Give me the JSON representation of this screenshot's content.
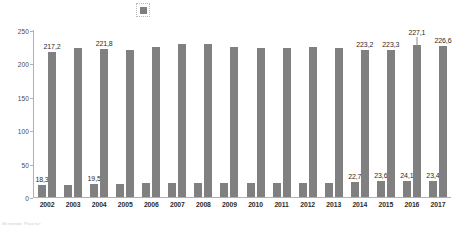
{
  "legend": {
    "marker_name": "series-swatch",
    "marker_color": "#7f7f7f"
  },
  "footnote": {
    "text": "Источник: Росстат"
  },
  "chart_data": {
    "type": "bar",
    "title": "",
    "subtitle": "",
    "xlabel": "",
    "ylabel": "",
    "ylim": [
      0,
      250
    ],
    "yticks": [
      0,
      50,
      100,
      150,
      200,
      250
    ],
    "ytick_labels": [
      "0",
      "50",
      "100",
      "150",
      "200",
      "250"
    ],
    "grid": false,
    "legend_position": "top",
    "bar_color": "#808080",
    "categories": [
      "2002",
      "2003",
      "2004",
      "2005",
      "2006",
      "2007",
      "2008",
      "2009",
      "2010",
      "2011",
      "2012",
      "2013",
      "2014",
      "2015",
      "2016",
      "2017"
    ],
    "series": [
      {
        "name": "series-1",
        "values": [
          18.3,
          18.2,
          19.5,
          20.0,
          20.4,
          21.0,
          21.3,
          21.1,
          20.5,
          21.2,
          21.7,
          21.3,
          22.7,
          23.6,
          24.1,
          23.4
        ],
        "labels": [
          "18,3",
          "",
          "19,5",
          "",
          "",
          "",
          "",
          "",
          "",
          "",
          "",
          "",
          "22,7",
          "23,6",
          "24,1",
          "23,4"
        ]
      },
      {
        "name": "series-2",
        "values": [
          217.2,
          222.5,
          221.8,
          219.5,
          225.0,
          228.5,
          229.0,
          224.0,
          222.5,
          223.5,
          224.5,
          222.5,
          220.5,
          220.0,
          227.1,
          226.6
        ],
        "labels": [
          "217,2",
          "",
          "221,8",
          "",
          "",
          "",
          "",
          "",
          "",
          "",
          "",
          "",
          "223,2",
          "223,3",
          "227,1",
          "226,6"
        ],
        "label_raised": [
          false,
          false,
          false,
          false,
          false,
          false,
          false,
          false,
          false,
          false,
          false,
          false,
          false,
          false,
          true,
          false
        ]
      }
    ]
  }
}
